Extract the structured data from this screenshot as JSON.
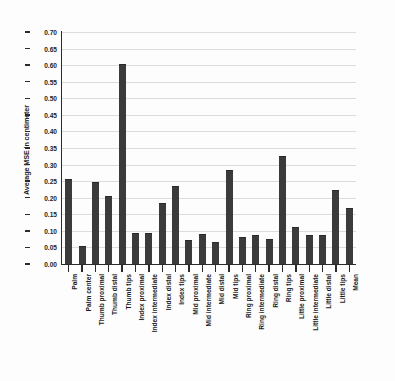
{
  "chart_data": {
    "type": "bar",
    "title": "",
    "subtitle": "",
    "xlabel": "",
    "ylabel": "Average MSE in centimeter",
    "ylim": [
      0.0,
      0.7
    ],
    "ytick_step": 0.05,
    "ytick_labels": [
      "0.00",
      "0.05",
      "0.10",
      "0.15",
      "0.20",
      "0.25",
      "0.30",
      "0.35",
      "0.40",
      "0.45",
      "0.50",
      "0.55",
      "0.60",
      "0.65",
      "0.70"
    ],
    "grid": true,
    "legend": null,
    "bar_color": "#3b3b3b",
    "grid_color": "#dcdcdc",
    "axis_color": "#2b2b2b",
    "background_color": "#fdfdfd",
    "categories": [
      "Palm",
      "Palm center",
      "Thumb proximal",
      "Thumb distal",
      "Thumb tips",
      "Index proximal",
      "Index intermediate",
      "Index distal",
      "Index tips",
      "Mid proximal",
      "Mid intermediate",
      "Mid distal",
      "Mid tips",
      "Ring proximal",
      "Ring intermediate",
      "Ring distal",
      "Ring tips",
      "Little proximal",
      "Little intermediate",
      "Little distal",
      "Little tips",
      "Mean"
    ],
    "values": [
      0.255,
      0.05,
      0.245,
      0.202,
      0.6,
      0.09,
      0.091,
      0.181,
      0.232,
      0.07,
      0.087,
      0.063,
      0.281,
      0.08,
      0.086,
      0.073,
      0.322,
      0.108,
      0.086,
      0.086,
      0.22,
      0.165
    ]
  }
}
